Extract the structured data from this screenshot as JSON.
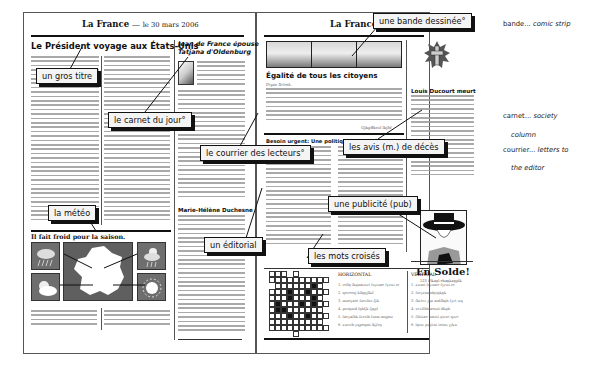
{
  "left_page": {
    "masthead_title": "La France",
    "masthead_sep": "—",
    "masthead_date": "le 30 mars 2006",
    "main_headline": "Le Président voyage aux États-Unis",
    "society_headline_1": "Jean de France épouse",
    "society_headline_2": "Tatjana d'Oldenburg",
    "letters_author": "Marie-Hélène Duchesne",
    "weather_headline": "Il fait froid pour la saison.",
    "weather_icons": [
      "rain-cloud-icon",
      "france-map",
      "rain-cloud-icon",
      "sun-cloud-icon",
      "sun-icon"
    ]
  },
  "right_page": {
    "masthead_title": "La France",
    "masthead_sep": "—",
    "feature_headline": "Égalité de tous les citoyens",
    "feature_byline": "Diyez Xrlmk.",
    "feature_signature": "Gjkgffkrol lkjhf",
    "obituary_headline": "Louis Ducourt meurt",
    "health_headline": "Besoin urgent: Une politique de santé publique",
    "ad_title": "En Solde!",
    "ad_sub": "123 Plkagl  ehagkagplk",
    "crossword": {
      "horizontal_title": "HORIZONTAL",
      "vertical_title": "VERTICAL",
      "horizontal_clues": [
        "1. rollg lkgaaswrt lsyume fyrwi io",
        "2. qoreenj kllggjlkif",
        "3. mnoyaot fucrfns fjik",
        "4. psognid fghljk fjgpl",
        "5. facyalhk fucrib lsnm mqpoz",
        "6. zucrib yqpoqmi lkjfrg"
      ],
      "vertical_clues": [
        "1. zwmt lsyume fyrwi io",
        "2. fscyrnandgtgkgk",
        "3. fkrtcv jga asdfhgh fyrt wq",
        "4. scvfthh aosnt dkgh",
        "5. fthtiao nmstt gtrsc qwe",
        "6. lgsw pqjitnt iotnu yjkw"
      ]
    }
  },
  "callouts": {
    "gros_titre": "un gros titre",
    "carnet": "le carnet du jour°",
    "courrier": "le courrier des lecteurs°",
    "meteo": "la météo",
    "editorial": "un éditorial",
    "mots_croises": "les mots croisés",
    "bande": "une bande dessinée°",
    "avis_deces": "les avis (m.) de décès",
    "publicite": "une publicité (pub)"
  },
  "glossary": {
    "bande_term": "bande...",
    "bande_def": "comic strip",
    "carnet_term": "carnet...",
    "carnet_def_1": "society",
    "carnet_def_2": "column",
    "courrier_term": "courrier...",
    "courrier_def_1": "letters to",
    "courrier_def_2": "the editor"
  }
}
